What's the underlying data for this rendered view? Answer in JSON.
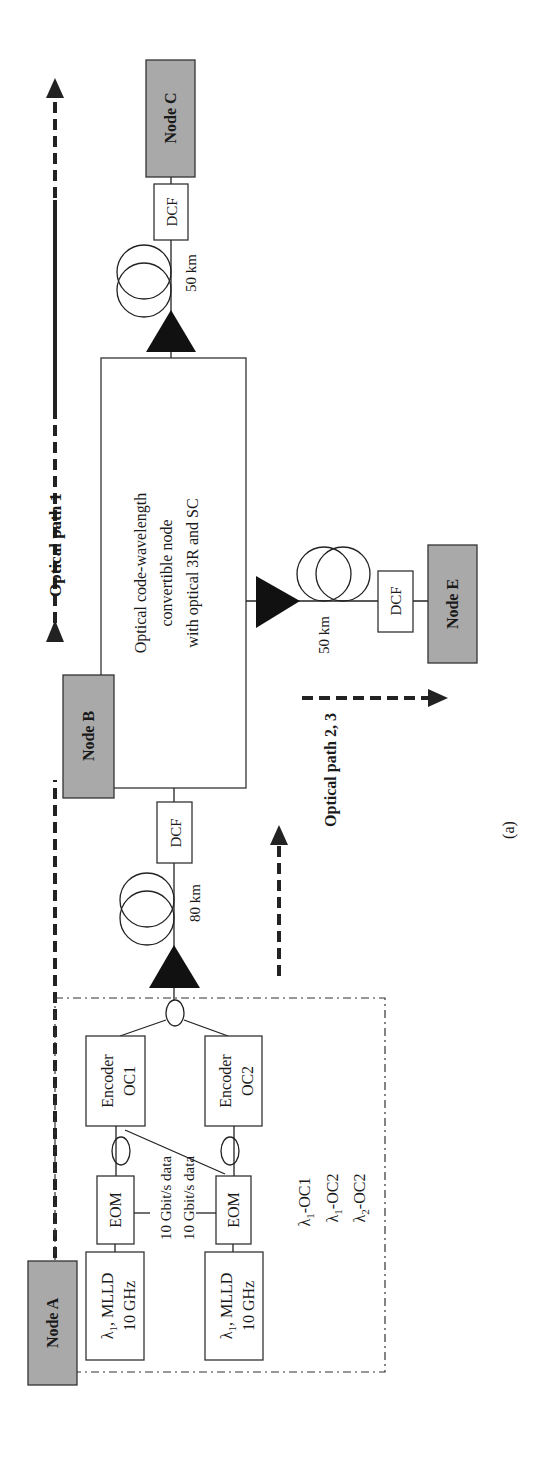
{
  "figure": {
    "caption": "(a)",
    "orientation": "rotated -90deg"
  },
  "nodes": {
    "a": "Node A",
    "b": "Node B",
    "c": "Node C",
    "e": "Node E"
  },
  "node_a_block": {
    "laser1": {
      "line1_prefix": "λ",
      "line1_sub": "1",
      "line1_suffix": ", MLLD",
      "line2": "10 GHz"
    },
    "laser2": {
      "line1_prefix": "λ",
      "line1_sub": "1",
      "line1_suffix": ", MLLD",
      "line2": "10 GHz"
    },
    "eom1": "EOM",
    "eom2": "EOM",
    "data1": "10 Gbit/s data",
    "data2": "10 Gbit/s data",
    "encoder1": {
      "line1": "Encoder",
      "line2": "OC1"
    },
    "encoder2": {
      "line1": "Encoder",
      "line2": "OC2"
    },
    "codes": [
      {
        "prefix": "λ",
        "sub": "1",
        "suffix": "-OC1"
      },
      {
        "prefix": "λ",
        "sub": "1",
        "suffix": "-OC2"
      },
      {
        "prefix": "λ",
        "sub": "2",
        "suffix": "-OC2"
      }
    ]
  },
  "links": {
    "a_to_b": {
      "distance": "80 km",
      "dcf": "DCF"
    },
    "b_to_c": {
      "distance": "50 km",
      "dcf": "DCF"
    },
    "b_to_e": {
      "distance": "50 km",
      "dcf": "DCF"
    }
  },
  "central_node": {
    "line1": "Optical code-wavelength",
    "line2": "convertible node",
    "line3": "with optical 3R and SC"
  },
  "paths": {
    "path1": "Optical path 1",
    "path23": "Optical path 2, 3"
  },
  "colors": {
    "node_fill": "#a9a9a9",
    "line": "#222222",
    "background": "#ffffff"
  }
}
